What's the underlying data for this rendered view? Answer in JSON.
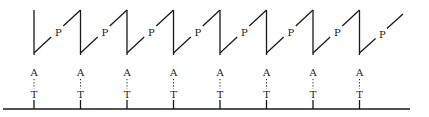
{
  "diagram": {
    "type": "sawtooth-repeat-diagram",
    "columns": 8,
    "column_x": [
      34,
      80.5,
      127,
      173.5,
      220,
      266.5,
      313,
      359.5
    ],
    "baseline": {
      "y": 109,
      "x_start": 3,
      "x_end": 410
    },
    "vertical_top_y": 10,
    "diagonal_bottom_y": 53,
    "final_segment_end": {
      "x": 403,
      "y": 14
    },
    "labels": {
      "top_label": "A",
      "bottom_label": "T",
      "diagonal_label": "P"
    },
    "colors": {
      "stroke": "#1a1a1a",
      "background": "#ffffff"
    }
  }
}
